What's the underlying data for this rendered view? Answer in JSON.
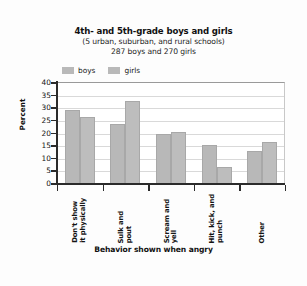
{
  "chart_data": {
    "type": "bar",
    "title": "4th- and 5th-grade boys and girls",
    "subtitle": "(5 urban, suburban, and rural schools)",
    "subtitle2": "287 boys and 270 girls",
    "xlabel": "Behavior shown when angry",
    "ylabel": "Percent",
    "ylim": [
      0,
      40
    ],
    "yticks": [
      0,
      5,
      10,
      15,
      20,
      25,
      30,
      35,
      40
    ],
    "ytick_labels": [
      "0",
      "5",
      "10",
      "15",
      "20",
      "25",
      "30",
      "35",
      "40"
    ],
    "grid": true,
    "legend_position": "top-left",
    "categories": [
      "Don't show it physically",
      "Sulk and pout",
      "Scream and yell",
      "Hit, kick, and punch",
      "Other"
    ],
    "category_lines": [
      [
        "Don't show",
        "it physically"
      ],
      [
        "Sulk and",
        "pout"
      ],
      [
        "Scream and",
        "yell"
      ],
      [
        "Hit, kick, and",
        "punch"
      ],
      [
        "Other"
      ]
    ],
    "series": [
      {
        "name": "boys",
        "color": "#b8b8b8",
        "values": [
          29.0,
          23.3,
          19.3,
          15.0,
          12.5
        ]
      },
      {
        "name": "girls",
        "color": "#bdbdbd",
        "values": [
          26.0,
          32.5,
          20.3,
          6.3,
          16.4
        ]
      }
    ]
  },
  "legend": {
    "entries": [
      {
        "label": "boys"
      },
      {
        "label": "girls"
      }
    ]
  },
  "colors": {
    "bar_gray": "#b8b8b8",
    "axis": "#2b2b2b",
    "gridline": "#d9d9d9",
    "background": "#fdfdfd",
    "text": "#141414"
  }
}
